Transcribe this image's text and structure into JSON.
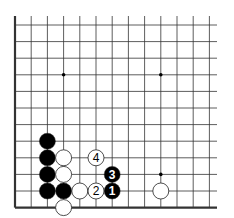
{
  "diagram": {
    "type": "go-board-fragment",
    "corner": "bottom-left",
    "columns": 13,
    "rows": 12,
    "edges": {
      "left": true,
      "bottom": true,
      "top": false,
      "right": false
    },
    "colors": {
      "line": "#333333",
      "black_stone": "#000000",
      "white_stone": "#ffffff",
      "stone_outline": "#222222"
    },
    "star_points": [
      {
        "col": 3,
        "row": 3
      },
      {
        "col": 9,
        "row": 3
      },
      {
        "col": 9,
        "row": 9
      }
    ],
    "stones": [
      {
        "color": "black",
        "col": 2,
        "row": 7,
        "label": ""
      },
      {
        "color": "black",
        "col": 2,
        "row": 8,
        "label": ""
      },
      {
        "color": "black",
        "col": 2,
        "row": 9,
        "label": ""
      },
      {
        "color": "black",
        "col": 2,
        "row": 10,
        "label": ""
      },
      {
        "color": "black",
        "col": 3,
        "row": 10,
        "label": ""
      },
      {
        "color": "white",
        "col": 3,
        "row": 8,
        "label": ""
      },
      {
        "color": "white",
        "col": 3,
        "row": 9,
        "label": ""
      },
      {
        "color": "white",
        "col": 3,
        "row": 11,
        "label": ""
      },
      {
        "color": "white",
        "col": 4,
        "row": 10,
        "label": ""
      },
      {
        "color": "white",
        "col": 9,
        "row": 10,
        "label": ""
      },
      {
        "color": "black",
        "col": 6,
        "row": 10,
        "label": "1"
      },
      {
        "color": "white",
        "col": 5,
        "row": 10,
        "label": "2"
      },
      {
        "color": "black",
        "col": 6,
        "row": 9,
        "label": "3"
      },
      {
        "color": "white",
        "col": 5,
        "row": 8,
        "label": "4"
      }
    ]
  }
}
